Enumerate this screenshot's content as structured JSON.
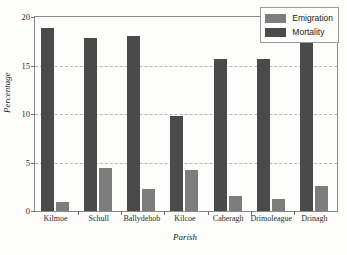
{
  "chart_data": {
    "type": "bar",
    "title": "",
    "xlabel": "Parish",
    "ylabel": "Percentage",
    "categories": [
      "Kilmoe",
      "Schull",
      "Ballydehob",
      "Kilcoe",
      "Caberagh",
      "Drimoleague",
      "Drinagh"
    ],
    "series": [
      {
        "name": "Mortality",
        "color": "#4a4a4a",
        "values": [
          18.9,
          17.8,
          18.0,
          9.8,
          15.7,
          15.7,
          18.5
        ]
      },
      {
        "name": "Emigration",
        "color": "#7d7d7d",
        "values": [
          0.9,
          4.4,
          2.3,
          4.2,
          1.5,
          1.2,
          2.6
        ]
      }
    ],
    "ylim": [
      0,
      20
    ],
    "yticks": [
      0,
      5,
      10,
      15,
      20
    ],
    "ytick_labels": [
      "0",
      "5",
      "10",
      "15",
      "20"
    ],
    "grid": true,
    "grid_axis": "y",
    "grid_style": "dashed",
    "legend_position": "top-right",
    "legend_order": [
      "Emigration",
      "Mortality"
    ]
  }
}
